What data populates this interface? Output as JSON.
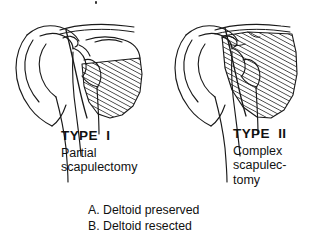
{
  "figure": {
    "background_color": "#ffffff",
    "ink_color": "#111111",
    "caption_type": "anatomical-line-drawing"
  },
  "panels": [
    {
      "id": "type-1",
      "heading": "TYPE  I",
      "description_lines": [
        "Partial",
        "scapulectomy"
      ],
      "resected_region": "lower scapular body",
      "hatching_angle_deg": 62
    },
    {
      "id": "type-2",
      "heading": "TYPE  II",
      "description_lines": [
        "Complex",
        "scapulec-",
        "tomy"
      ],
      "resected_region": "entire scapular body and glenoid",
      "hatching_angle_deg": 62
    }
  ],
  "legend": {
    "items": [
      "A. Deltoid preserved",
      "B. Deltoid resected"
    ]
  }
}
